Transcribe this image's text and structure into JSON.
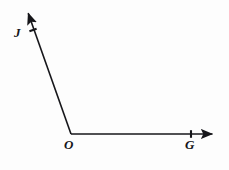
{
  "figure": {
    "kind": "geometry-angle-diagram",
    "background_color": "#fdfdfd",
    "stroke_color": "#16161a",
    "stroke_width": 1.6,
    "canvas": {
      "width": 229,
      "height": 170
    },
    "vertex": {
      "name": "O",
      "x": 71,
      "y": 134
    },
    "points": [
      {
        "name": "J",
        "x": 33,
        "y": 30,
        "label_x": 14,
        "label_y": 26,
        "marker": "tick"
      },
      {
        "name": "O",
        "x": 71,
        "y": 134,
        "label_x": 64,
        "label_y": 138,
        "marker": "none"
      },
      {
        "name": "G",
        "x": 191,
        "y": 134,
        "label_x": 185,
        "label_y": 138,
        "marker": "tick"
      }
    ],
    "rays": [
      {
        "name": "ray-OJ",
        "from": {
          "x": 71,
          "y": 134
        },
        "to": {
          "x": 26,
          "y": 7
        },
        "arrow_at_end": true,
        "through_point": "J"
      },
      {
        "name": "ray-OG",
        "from": {
          "x": 71,
          "y": 134
        },
        "to": {
          "x": 220,
          "y": 134
        },
        "arrow_at_end": true,
        "through_point": "G"
      }
    ],
    "labels": {
      "J": "J",
      "O": "O",
      "G": "G"
    }
  }
}
